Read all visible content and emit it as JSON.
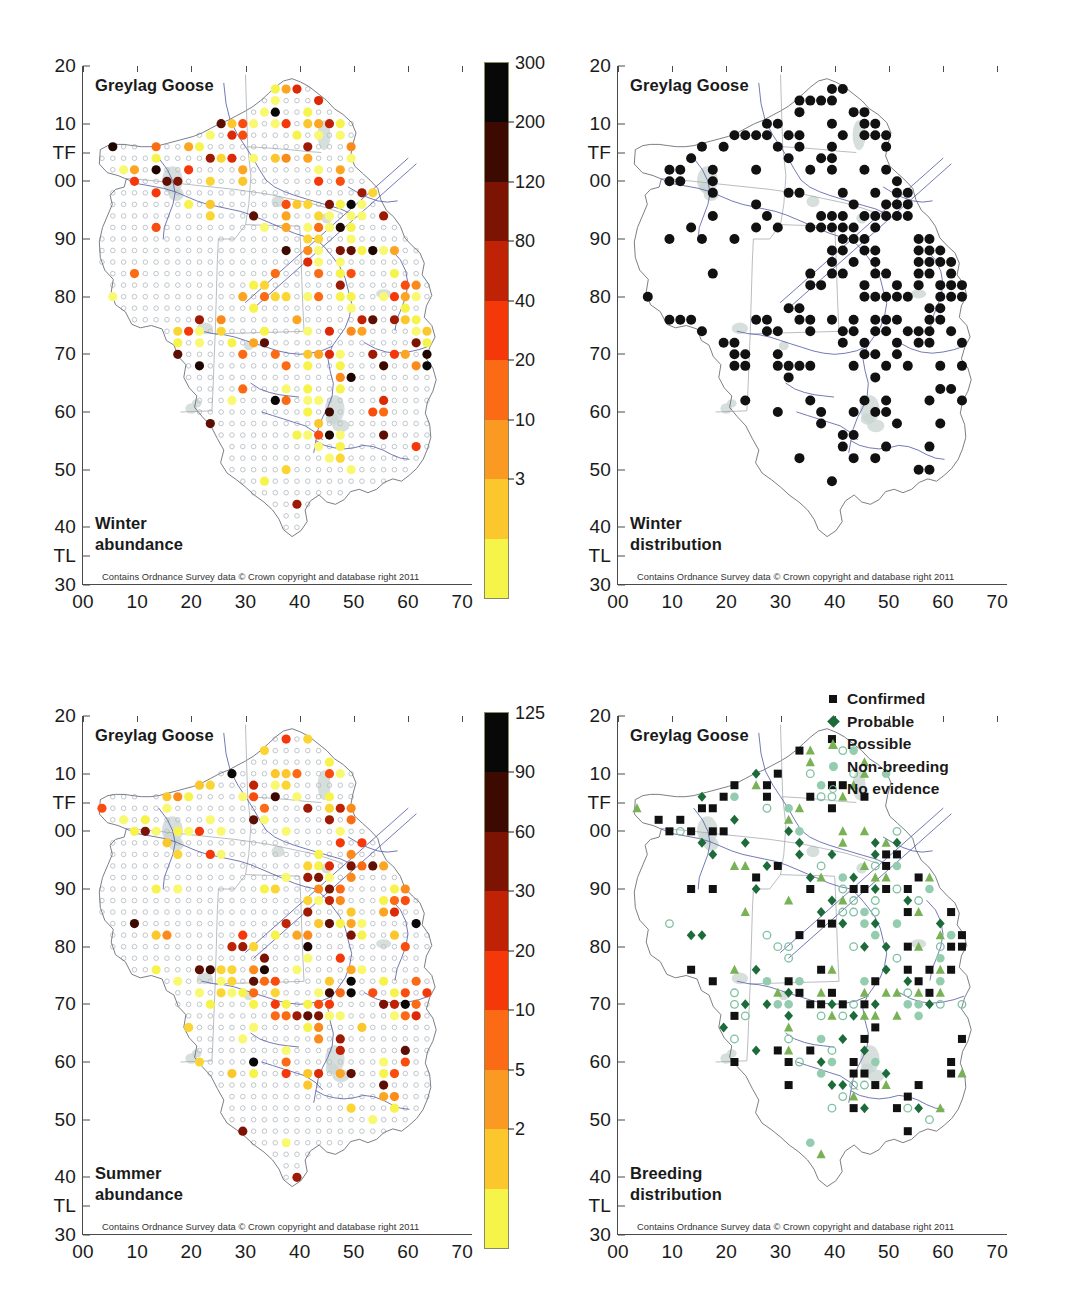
{
  "figure": {
    "species": "Greylag Goose",
    "attribution": "Contains Ordnance Survey data © Crown copyright and database right 2011"
  },
  "axes": {
    "y_ticks": [
      "20",
      "10",
      "TF",
      "00",
      "90",
      "80",
      "70",
      "60",
      "50",
      "40",
      "TL",
      "30"
    ],
    "x_ticks": [
      "00",
      "10",
      "20",
      "30",
      "40",
      "50",
      "60",
      "70"
    ]
  },
  "panels": [
    {
      "id": "winter-abundance",
      "title": "Greylag Goose",
      "label_line1": "Winter",
      "label_line2": "abundance"
    },
    {
      "id": "winter-distribution",
      "title": "Greylag Goose",
      "label_line1": "Winter",
      "label_line2": "distribution"
    },
    {
      "id": "summer-abundance",
      "title": "Greylag Goose",
      "label_line1": "Summer",
      "label_line2": "abundance"
    },
    {
      "id": "breeding-distribution",
      "title": "Greylag Goose",
      "label_line1": "Breeding",
      "label_line2": "distribution"
    }
  ],
  "colorbars": {
    "winter": {
      "ticks": [
        "300",
        "200",
        "120",
        "80",
        "40",
        "20",
        "10",
        "3"
      ],
      "max": "300",
      "min": "3"
    },
    "summer": {
      "ticks": [
        "125",
        "90",
        "60",
        "30",
        "20",
        "10",
        "5",
        "2"
      ],
      "max": "125",
      "min": "2"
    }
  },
  "legend": {
    "items": [
      {
        "label": "Confirmed",
        "marker": "filled-square-icon",
        "color": "#111111"
      },
      {
        "label": "Probable",
        "marker": "filled-diamond-icon",
        "color": "#1d6b3a"
      },
      {
        "label": "Possible",
        "marker": "filled-triangle-icon",
        "color": "#79b155"
      },
      {
        "label": "Non-breeding",
        "marker": "filled-circle-icon",
        "color": "#93ccae"
      },
      {
        "label": "No evidence",
        "marker": "open-circle-icon",
        "color": "#7fc0a0"
      }
    ]
  },
  "chart_data": {
    "type": "scatter",
    "xlabel": "Easting (10 km grid)",
    "ylabel": "Northing (10 km grid)",
    "xlim": [
      0,
      70
    ],
    "ylim": [
      30,
      120
    ],
    "grid": false,
    "panel_layout": "2x2",
    "panels": [
      {
        "name": "Winter abundance",
        "type": "scatter",
        "colormap": "hot-reversed",
        "colorbar_ticks": [
          3,
          10,
          20,
          40,
          80,
          120,
          200,
          300
        ],
        "colorbar_label": "",
        "marker": "filled circle coloured by count; small open circle = surveyed, zero birds",
        "note": "Tetrad grid across Norfolk / Suffolk / Cambridgeshire region"
      },
      {
        "name": "Winter distribution",
        "type": "scatter",
        "marker": "filled black circle = present",
        "series": [
          {
            "name": "Present",
            "color": "#111111"
          }
        ]
      },
      {
        "name": "Summer abundance",
        "type": "scatter",
        "colormap": "hot-reversed",
        "colorbar_ticks": [
          2,
          5,
          10,
          20,
          30,
          60,
          90,
          125
        ],
        "colorbar_label": "",
        "marker": "filled circle coloured by count; small open circle = surveyed, zero birds"
      },
      {
        "name": "Breeding distribution",
        "type": "scatter",
        "series": [
          {
            "name": "Confirmed",
            "color": "#111111",
            "marker": "square"
          },
          {
            "name": "Probable",
            "color": "#1d6b3a",
            "marker": "diamond"
          },
          {
            "name": "Possible",
            "color": "#79b155",
            "marker": "triangle"
          },
          {
            "name": "Non-breeding",
            "color": "#93ccae",
            "marker": "circle"
          },
          {
            "name": "No evidence",
            "color": "#7fc0a0",
            "marker": "open-circle"
          }
        ]
      }
    ]
  }
}
